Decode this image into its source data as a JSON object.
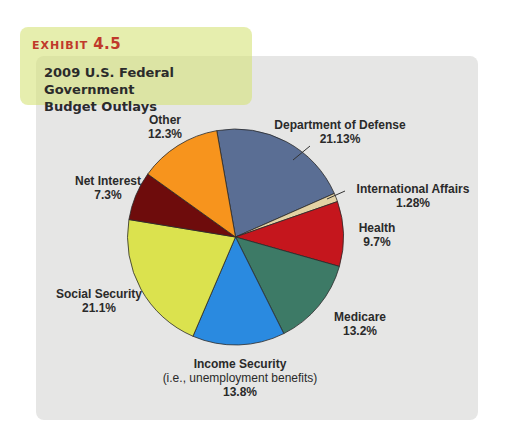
{
  "exhibit": {
    "label": "EXHIBIT",
    "number": "4.5"
  },
  "title": {
    "line1": "2009 U.S. Federal Government",
    "line2": "Budget Outlays"
  },
  "chart_data": {
    "type": "pie",
    "title": "2009 U.S. Federal Government Budget Outlays",
    "start_angle_deg": -10,
    "direction": "clockwise",
    "categories": [
      "Department of Defense",
      "International Affairs",
      "Health",
      "Medicare",
      "Income Security",
      "Social Security",
      "Net Interest",
      "Other"
    ],
    "values": [
      21.13,
      1.28,
      9.7,
      13.2,
      13.8,
      21.1,
      7.3,
      12.3
    ],
    "unit": "%",
    "colors": [
      "#5a6e94",
      "#e3d2a4",
      "#c5161d",
      "#3d7a66",
      "#2a8ae0",
      "#dbe24e",
      "#6e0c0c",
      "#f7941d"
    ],
    "annotations": {
      "Income Security": "(i.e., unemployment benefits)"
    },
    "legend": "none (direct labels)"
  },
  "labels": {
    "defense": {
      "name": "Department of Defense",
      "value": "21.13%"
    },
    "intl": {
      "name": "International Affairs",
      "value": "1.28%"
    },
    "health": {
      "name": "Health",
      "value": "9.7%"
    },
    "medicare": {
      "name": "Medicare",
      "value": "13.2%"
    },
    "income": {
      "name": "Income Security",
      "note": "(i.e., unemployment benefits)",
      "value": "13.8%"
    },
    "social": {
      "name": "Social Security",
      "value": "21.1%"
    },
    "interest": {
      "name": "Net Interest",
      "value": "7.3%"
    },
    "other": {
      "name": "Other",
      "value": "12.3%"
    }
  }
}
